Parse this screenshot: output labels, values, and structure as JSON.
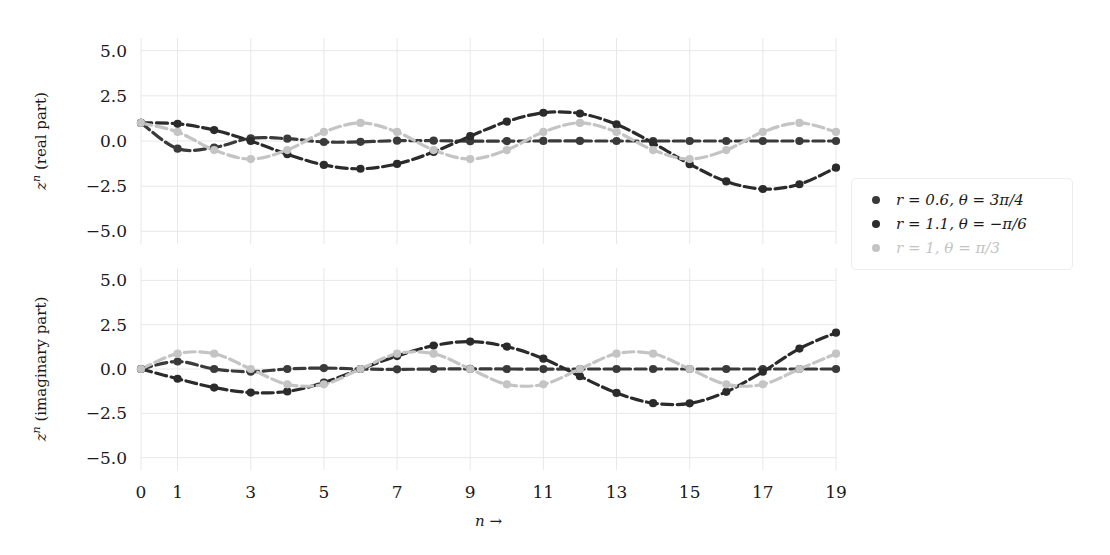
{
  "figure": {
    "background": "#ffffff",
    "grid_color": "#e8e8e8",
    "text_color": "#1a1a1a"
  },
  "legend": {
    "border_color": "#ededed",
    "entries": [
      {
        "label": "r = 0.6, θ = 3π/4",
        "color": "#3a3a3a",
        "r": 0.6,
        "theta_label": "3π/4"
      },
      {
        "label": "r = 1.1, θ = −π/6",
        "color": "#2b2b2b",
        "r": 1.1,
        "theta_label": "−π/6"
      },
      {
        "label": "r = 1, θ = π/3",
        "color": "#c4c4c4",
        "r": 1.0,
        "theta_label": "π/3"
      }
    ]
  },
  "chart_data": [
    {
      "type": "line",
      "title": "",
      "subplot": "top",
      "xlabel": "",
      "ylabel": "zⁿ (real part)",
      "xlim": [
        0,
        19
      ],
      "ylim": [
        -5.7,
        5.7
      ],
      "yticks": [
        5.0,
        2.5,
        0.0,
        -2.5,
        -5.0
      ],
      "ytick_labels": [
        "5.0",
        "2.5",
        "0.0",
        "−2.5",
        "−5.0"
      ],
      "xticks": [
        0,
        1,
        3,
        5,
        7,
        9,
        11,
        13,
        15,
        17,
        19
      ],
      "xtick_labels": [
        "0",
        "1",
        "3",
        "5",
        "7",
        "9",
        "11",
        "13",
        "15",
        "17",
        "19"
      ],
      "grid": true,
      "legend_position": "right-outside",
      "x": [
        0,
        1,
        2,
        3,
        4,
        5,
        6,
        7,
        8,
        9,
        10,
        11,
        12,
        13,
        14,
        15,
        16,
        17,
        18,
        19
      ],
      "series": [
        {
          "name": "r = 0.6, θ = 3π/4",
          "color": "#3a3a3a",
          "values": [
            1.0,
            -0.424,
            -0.36,
            0.153,
            0.13,
            -0.055,
            -0.047,
            0.02,
            0.017,
            -0.007,
            -0.006,
            0.003,
            0.002,
            -0.001,
            -0.001,
            0.0,
            0.0,
            0.0,
            0.0,
            0.0
          ]
        },
        {
          "name": "r = 1.1, θ = −π/6",
          "color": "#2b2b2b",
          "values": [
            1.0,
            0.953,
            0.605,
            0.0,
            -0.732,
            -1.323,
            -1.536,
            -1.268,
            -0.605,
            0.266,
            1.077,
            1.562,
            1.522,
            0.92,
            -0.111,
            -1.28,
            -2.235,
            -2.657,
            -2.394,
            -1.476
          ]
        },
        {
          "name": "r = 1, θ = π/3",
          "color": "#c4c4c4",
          "values": [
            1.0,
            0.5,
            -0.5,
            -1.0,
            -0.5,
            0.5,
            1.0,
            0.5,
            -0.5,
            -1.0,
            -0.5,
            0.5,
            1.0,
            0.5,
            -0.5,
            -1.0,
            -0.5,
            0.5,
            1.0,
            0.5
          ]
        }
      ],
      "series_scaled_note": "r=1.1 real part uses 1.1^n*cos(-n*pi/6)"
    },
    {
      "type": "line",
      "title": "",
      "subplot": "bottom",
      "xlabel": "n  →",
      "ylabel": "zⁿ (imaginary part)",
      "xlim": [
        0,
        19
      ],
      "ylim": [
        -5.7,
        5.7
      ],
      "yticks": [
        5.0,
        2.5,
        0.0,
        -2.5,
        -5.0
      ],
      "ytick_labels": [
        "5.0",
        "2.5",
        "0.0",
        "−2.5",
        "−5.0"
      ],
      "xticks": [
        0,
        1,
        3,
        5,
        7,
        9,
        11,
        13,
        15,
        17,
        19
      ],
      "xtick_labels": [
        "0",
        "1",
        "3",
        "5",
        "7",
        "9",
        "11",
        "13",
        "15",
        "17",
        "19"
      ],
      "grid": true,
      "x": [
        0,
        1,
        2,
        3,
        4,
        5,
        6,
        7,
        8,
        9,
        10,
        11,
        12,
        13,
        14,
        15,
        16,
        17,
        18,
        19
      ],
      "series": [
        {
          "name": "r = 0.6, θ = 3π/4",
          "color": "#3a3a3a",
          "values": [
            0.0,
            0.424,
            0.0,
            -0.153,
            0.0,
            0.055,
            0.0,
            -0.02,
            0.0,
            0.007,
            0.0,
            -0.003,
            0.0,
            0.001,
            0.0,
            0.0,
            0.0,
            0.0,
            0.0,
            0.0
          ]
        },
        {
          "name": "r = 1.1, θ = −π/6",
          "color": "#2b2b2b",
          "values": [
            0.0,
            -0.55,
            -1.048,
            -1.331,
            -1.268,
            -0.764,
            0.0,
            0.732,
            1.32,
            1.545,
            1.265,
            0.585,
            -0.409,
            -1.348,
            -1.928,
            -1.938,
            -1.29,
            -0.15,
            1.152,
            2.049
          ]
        },
        {
          "name": "r = 1, θ = π/3",
          "color": "#c4c4c4",
          "values": [
            0.0,
            0.866,
            0.866,
            0.0,
            -0.866,
            -0.866,
            0.0,
            0.866,
            0.866,
            0.0,
            -0.866,
            -0.866,
            0.0,
            0.866,
            0.866,
            0.0,
            -0.866,
            -0.866,
            0.0,
            0.866
          ]
        }
      ],
      "series_scaled_note": "r=1.1 imaginary part uses 1.1^n*sin(-n*pi/6)"
    }
  ]
}
